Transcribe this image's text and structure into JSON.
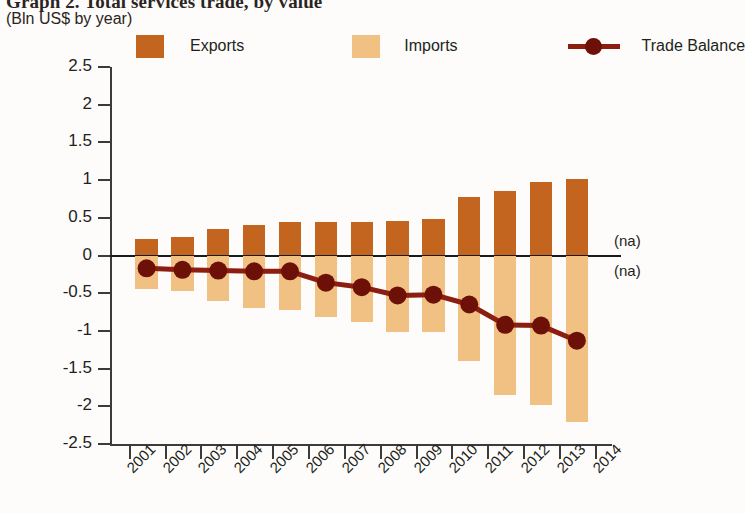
{
  "title": "Graph 2. Total services trade, by value",
  "subtitle": "(Bln US$ by year)",
  "legend": {
    "exports": "Exports",
    "imports": "Imports",
    "balance": "Trade Balance"
  },
  "colors": {
    "exports": "#c3651f",
    "imports": "#f0c182",
    "balance": "#8c1d11",
    "balance_marker": "#6d1008",
    "axis": "#3b3b3b"
  },
  "notes": {
    "na_top": "(na)",
    "na_bottom": "(na)"
  },
  "chart_data": {
    "type": "bar",
    "title": "Graph 2. Total services trade, by value",
    "subtitle": "(Bln US$ by year)",
    "xlabel": "",
    "ylabel": "Bln US$",
    "ylim": [
      -2.5,
      2.5
    ],
    "ytick_labels": [
      "2.5",
      "2",
      "1.5",
      "1",
      "0.5",
      "0",
      "-0.5",
      "-1",
      "-1.5",
      "-2",
      "-2.5"
    ],
    "ytick_values": [
      2.5,
      2,
      1.5,
      1,
      0.5,
      0,
      -0.5,
      -1,
      -1.5,
      -2,
      -2.5
    ],
    "axis_tick_labels": [
      "2001",
      "2002",
      "2003",
      "2004",
      "2005",
      "2006",
      "2007",
      "2008",
      "2009",
      "2010",
      "2011",
      "2012",
      "2013",
      "2014"
    ],
    "categories": [
      "2001",
      "2002",
      "2003",
      "2004",
      "2005",
      "2006",
      "2007",
      "2008",
      "2009",
      "2010",
      "2011",
      "2012",
      "2013"
    ],
    "grid": false,
    "legend_position": "top",
    "series": [
      {
        "name": "Exports",
        "type": "bar",
        "color": "#c3651f",
        "values": [
          0.22,
          0.24,
          0.35,
          0.41,
          0.45,
          0.44,
          0.45,
          0.46,
          0.48,
          0.77,
          0.85,
          0.97,
          1.01
        ]
      },
      {
        "name": "Imports",
        "type": "bar",
        "color": "#f0c182",
        "values": [
          -0.45,
          -0.47,
          -0.6,
          -0.69,
          -0.72,
          -0.82,
          -0.88,
          -1.02,
          -1.02,
          -1.4,
          -1.85,
          -1.98,
          -2.21
        ]
      },
      {
        "name": "Trade Balance",
        "type": "line",
        "color": "#8c1d11",
        "values": [
          -0.17,
          -0.19,
          -0.2,
          -0.21,
          -0.21,
          -0.36,
          -0.42,
          -0.53,
          -0.52,
          -0.65,
          -0.92,
          -0.93,
          -1.13
        ]
      }
    ]
  }
}
